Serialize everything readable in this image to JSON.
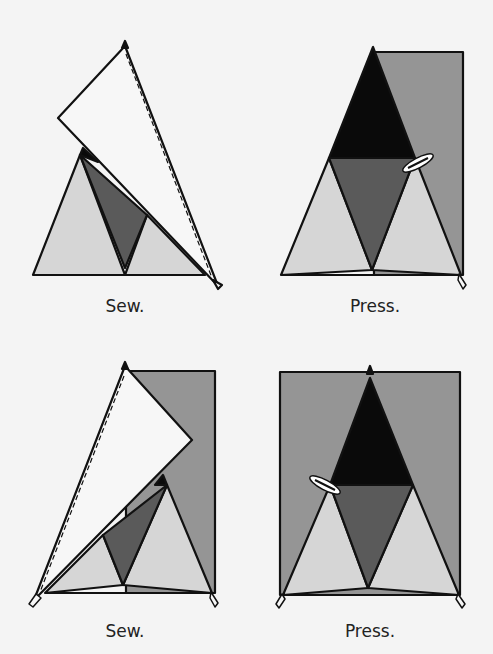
{
  "colors": {
    "background": "#f4f4f4",
    "light": "#d6d6d6",
    "medium": "#959595",
    "dark": "#5a5a5a",
    "black": "#0a0a0a",
    "flap": "#f7f7f7",
    "outline": "#111111"
  },
  "panels": [
    {
      "id": "sew-1",
      "caption": "Sew.",
      "step": "Sew right flap along dashed seam line"
    },
    {
      "id": "press-1",
      "caption": "Press.",
      "step": "Press right flap open"
    },
    {
      "id": "sew-2",
      "caption": "Sew.",
      "step": "Sew left flap along dashed seam line"
    },
    {
      "id": "press-2",
      "caption": "Press.",
      "step": "Press left flap open"
    }
  ]
}
